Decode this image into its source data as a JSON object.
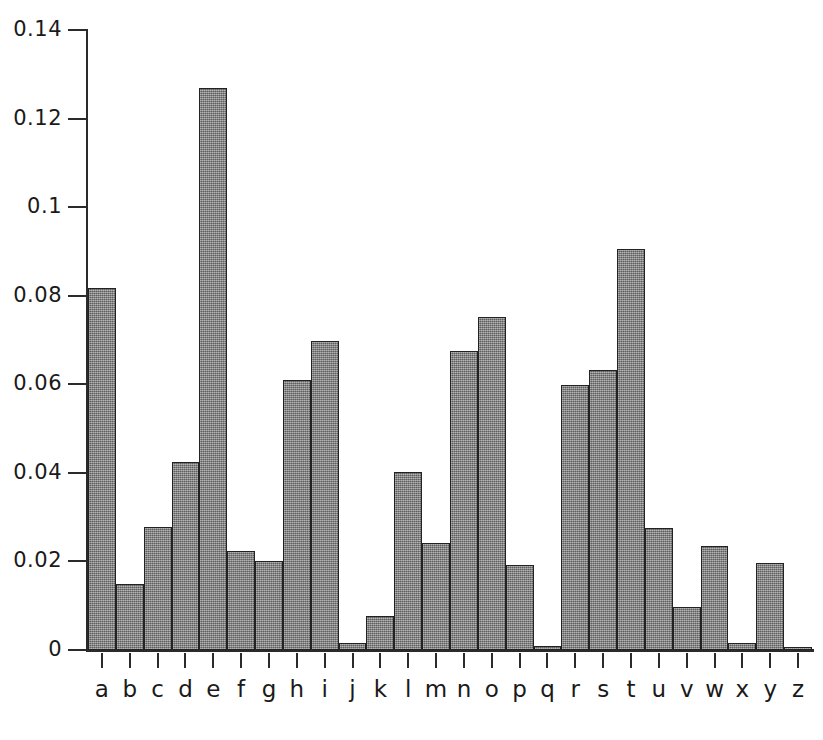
{
  "chart_data": {
    "type": "bar",
    "title": "",
    "subtitle": "",
    "xlabel": "",
    "ylabel": "",
    "categories": [
      "a",
      "b",
      "c",
      "d",
      "e",
      "f",
      "g",
      "h",
      "i",
      "j",
      "k",
      "l",
      "m",
      "n",
      "o",
      "p",
      "q",
      "r",
      "s",
      "t",
      "u",
      "v",
      "w",
      "x",
      "y",
      "z"
    ],
    "values": [
      0.0817,
      0.0149,
      0.0278,
      0.0425,
      0.127,
      0.0223,
      0.0202,
      0.0609,
      0.0697,
      0.0015,
      0.0077,
      0.0403,
      0.0241,
      0.0675,
      0.0751,
      0.0193,
      0.001,
      0.0599,
      0.0633,
      0.0906,
      0.0276,
      0.0098,
      0.0236,
      0.0015,
      0.0197,
      0.0007
    ],
    "ylim": [
      0,
      0.14
    ],
    "ytick_values": [
      0,
      0.02,
      0.04,
      0.06,
      0.08,
      0.1,
      0.12,
      0.14
    ],
    "ytick_labels": [
      "0",
      "0.02",
      "0.04",
      "0.06",
      "0.08",
      "0.1",
      "0.12",
      "0.14"
    ],
    "grid": false,
    "legend": null,
    "series": [
      {
        "name": "letter frequency",
        "values": [
          0.0817,
          0.0149,
          0.0278,
          0.0425,
          0.127,
          0.0223,
          0.0202,
          0.0609,
          0.0697,
          0.0015,
          0.0077,
          0.0403,
          0.0241,
          0.0675,
          0.0751,
          0.0193,
          0.001,
          0.0599,
          0.0633,
          0.0906,
          0.0276,
          0.0098,
          0.0236,
          0.0015,
          0.0197,
          0.0007
        ]
      }
    ],
    "bar_fill_color": "#878787",
    "bar_edge_color": "#222222",
    "axis_color": "#2b2b2b"
  },
  "caption": {
    "text": ""
  }
}
